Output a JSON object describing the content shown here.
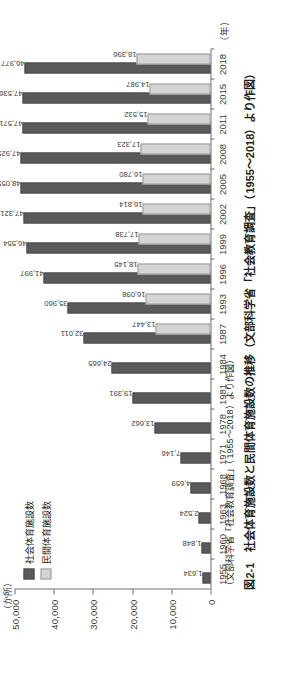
{
  "figure": {
    "number": "図2-1",
    "title": "社会体育施設数と民間体育施設数の推移",
    "source": "（文部科学省「社会教育調査」（1955～2018）より作図）",
    "full_caption": "図2-1　社会体育施設数と民間体育施設数の推移（文部科学省「社会教育調査」（1955～2018）より作図）",
    "unit_y": "（か所）",
    "unit_x": "（年）"
  },
  "legend": {
    "items": [
      {
        "label": "社会体育施設数",
        "color": "#5a5a5a",
        "swatch": "dark"
      },
      {
        "label": "民間体育施設数",
        "color": "#d4d4d4",
        "swatch": "light"
      }
    ]
  },
  "axis": {
    "y_ticks": [
      "0",
      "10,000",
      "20,000",
      "30,000",
      "40,000",
      "50,000"
    ],
    "y_values": [
      0,
      10000,
      20000,
      30000,
      40000,
      50000
    ],
    "y_min": 0,
    "y_max": 50000,
    "x_ticks": [
      "1955",
      "1960",
      "1963",
      "1968",
      "1971",
      "1978",
      "1981",
      "1984",
      "1987",
      "1993",
      "1996",
      "1999",
      "2002",
      "2005",
      "2008",
      "2011",
      "2015",
      "2018"
    ]
  },
  "chart_data": {
    "type": "bar",
    "title": "社会体育施設数と民間体育施設数の推移",
    "subtitle": "（文部科学省「社会教育調査」（1955～2018）より作図）",
    "xlabel": "（年）",
    "ylabel": "（か所）",
    "ylim": [
      0,
      50000
    ],
    "grid": false,
    "legend_position": "top-left",
    "categories": [
      "1955",
      "1960",
      "1963",
      "1968",
      "1971",
      "1978",
      "1981",
      "1984",
      "1987",
      "1993",
      "1996",
      "1999",
      "2002",
      "2005",
      "2008",
      "2011",
      "2015",
      "2018"
    ],
    "series": [
      {
        "name": "社会体育施設数",
        "color": "#5a5a5a",
        "values": [
          1634,
          1848,
          2524,
          4659,
          7146,
          13662,
          19391,
          24665,
          32011,
          35960,
          41997,
          46554,
          47321,
          48055,
          47925,
          47571,
          47536,
          46977
        ],
        "labels": [
          "1,634",
          "1,848",
          "2,524",
          "4,659",
          "7,146",
          "13,662",
          "19,391",
          "24,665",
          "32,011",
          "35,960",
          "41,997",
          "46,554",
          "47,321",
          "48,055",
          "47,925",
          "47,571",
          "47,536",
          "46,977"
        ]
      },
      {
        "name": "民間体育施設数",
        "color": "#d4d4d4",
        "values": [
          null,
          null,
          null,
          null,
          null,
          null,
          null,
          null,
          13447,
          16098,
          18145,
          17738,
          16814,
          16780,
          17323,
          15532,
          14987,
          18396
        ],
        "labels": [
          "",
          "",
          "",
          "",
          "",
          "",
          "",
          "",
          "13,447",
          "16,098",
          "18,145",
          "17,738",
          "16,814",
          "16,780",
          "17,323",
          "15,532",
          "14,987",
          "18,396"
        ]
      }
    ]
  }
}
